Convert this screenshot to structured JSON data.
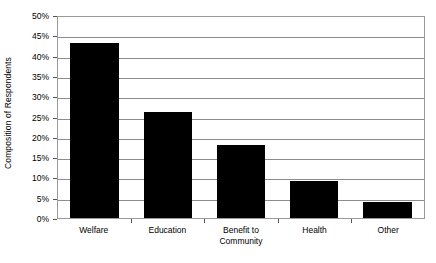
{
  "chart_data": {
    "type": "bar",
    "title": "",
    "subtitle": "",
    "xlabel": "",
    "ylabel": "Composition of Respondents",
    "categories": [
      "Welfare",
      "Education",
      "Benefit to\nCommunity",
      "Health",
      "Other"
    ],
    "values": [
      43,
      26,
      18,
      9,
      4
    ],
    "ylim": [
      0,
      50
    ],
    "ytick_step": 5,
    "ytick_labels": [
      "50%",
      "45%",
      "40%",
      "35%",
      "30%",
      "25%",
      "20%",
      "15%",
      "10%",
      "5%",
      "0%"
    ],
    "ytick_values": [
      50,
      45,
      40,
      35,
      30,
      25,
      20,
      15,
      10,
      5,
      0
    ],
    "grid": true,
    "grid_axis": "y",
    "legend": false,
    "legend_position": "none",
    "series": [
      {
        "name": "Composition of Respondents",
        "values": [
          43,
          26,
          18,
          9,
          4
        ]
      }
    ],
    "colors": {
      "bar": "#000000",
      "gridline": "#8c8c8c",
      "frame": "#9a9a9a",
      "plot_background": "#ffffff",
      "text": "#000000"
    }
  }
}
